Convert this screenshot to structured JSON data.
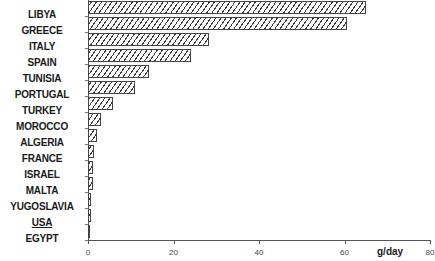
{
  "chart_data": {
    "type": "bar",
    "orientation": "horizontal",
    "title": "",
    "xlabel": "g/day",
    "ylabel": "",
    "xlim": [
      0,
      80
    ],
    "xticks": [
      0,
      20,
      40,
      60,
      80
    ],
    "xtick_labels": [
      "0",
      "20",
      "40",
      "60",
      "80"
    ],
    "grid": false,
    "legend": null,
    "pattern": "diagonal-hatch",
    "underlined_categories": [
      "USA"
    ],
    "categories": [
      "LIBYA",
      "GREECE",
      "ITALY",
      "SPAIN",
      "TUNISIA",
      "PORTUGAL",
      "TURKEY",
      "MOROCCO",
      "ALGERIA",
      "FRANCE",
      "ISRAEL",
      "MALTA",
      "YUGOSLAVIA",
      "USA",
      "EGYPT"
    ],
    "values": [
      65,
      60.5,
      28.3,
      24.1,
      14.2,
      11.0,
      5.9,
      3.1,
      2.0,
      1.4,
      1.2,
      1.2,
      0.8,
      0.6,
      0.5
    ]
  }
}
